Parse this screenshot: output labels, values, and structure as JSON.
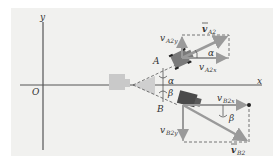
{
  "figure": {
    "axes": {
      "x_label": "x",
      "y_label": "y",
      "origin_label": "O"
    },
    "pucks": [
      {
        "id": "A",
        "label": "A"
      },
      {
        "id": "B",
        "label": "B"
      }
    ],
    "vectors": {
      "vA2": {
        "symbol": "v",
        "sub": "A2"
      },
      "vA2x": {
        "symbol": "v",
        "sub": "A2x"
      },
      "vA2y": {
        "symbol": "v",
        "sub": "A2y"
      },
      "vB2": {
        "symbol": "v",
        "sub": "B2"
      },
      "vB2x": {
        "symbol": "v",
        "sub": "B2x"
      },
      "vB2y": {
        "symbol": "v",
        "sub": "B2y"
      }
    },
    "angles": {
      "alpha": "α",
      "beta": "β"
    },
    "colors": {
      "background": "#f1f1ef",
      "axis": "#555555",
      "vector": "#9a9a9a",
      "puck": "#7a7a7a",
      "puck_dark": "#4a4a4a",
      "ghost_puck": "#c9c9c9",
      "dashed": "#555555"
    }
  }
}
